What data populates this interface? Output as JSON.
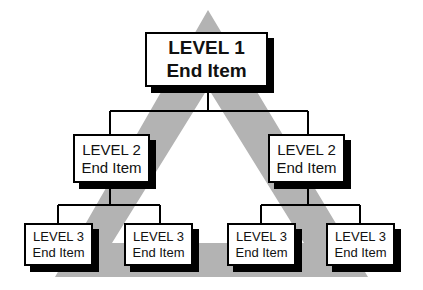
{
  "diagram": {
    "type": "hierarchy",
    "background_shape": "hollow-triangle",
    "colors": {
      "triangle": "#b3b3b3",
      "box_border": "#000000",
      "box_fill": "#ffffff",
      "shadow": "#000000",
      "connector": "#000000"
    },
    "nodes": {
      "level1": {
        "line1": "LEVEL 1",
        "line2": "End Item"
      },
      "level2_left": {
        "line1": "LEVEL 2",
        "line2": "End Item"
      },
      "level2_right": {
        "line1": "LEVEL 2",
        "line2": "End Item"
      },
      "level3_1": {
        "line1": "LEVEL 3",
        "line2": "End Item"
      },
      "level3_2": {
        "line1": "LEVEL 3",
        "line2": "End Item"
      },
      "level3_3": {
        "line1": "LEVEL 3",
        "line2": "End Item"
      },
      "level3_4": {
        "line1": "LEVEL 3",
        "line2": "End Item"
      }
    },
    "edges": [
      [
        "level1",
        "level2_left"
      ],
      [
        "level1",
        "level2_right"
      ],
      [
        "level2_left",
        "level3_1"
      ],
      [
        "level2_left",
        "level3_2"
      ],
      [
        "level2_right",
        "level3_3"
      ],
      [
        "level2_right",
        "level3_4"
      ]
    ]
  }
}
